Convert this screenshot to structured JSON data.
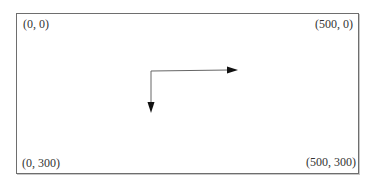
{
  "diagram": {
    "title": "",
    "corners": {
      "top_left": "(0, 0)",
      "top_right": "(500, 0)",
      "bottom_left": "(0, 300)",
      "bottom_right": "(500, 300)"
    },
    "arrows": [
      {
        "name": "x-axis-arrow",
        "direction": "right"
      },
      {
        "name": "y-axis-arrow",
        "direction": "down"
      }
    ],
    "colors": {
      "border": "#6e6e6e",
      "arrow": "#555555",
      "text": "#333333"
    }
  }
}
